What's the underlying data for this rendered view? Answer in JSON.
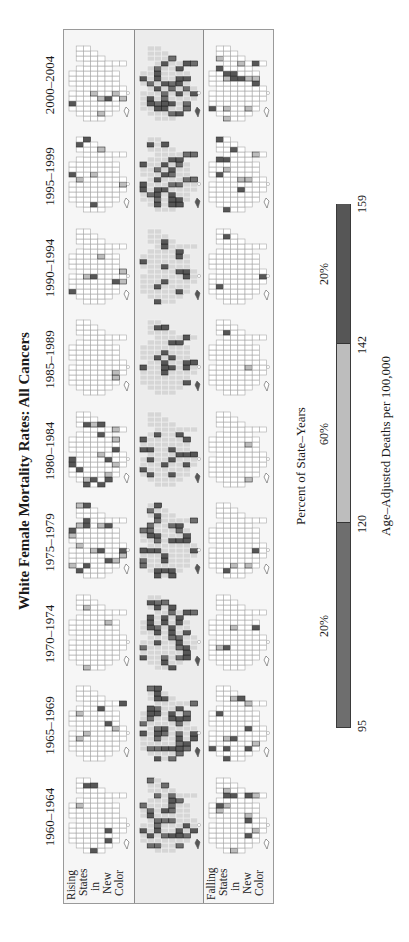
{
  "title": "White Female Mortality Rates: All Cancers",
  "periods": [
    "1960–1964",
    "1965–1969",
    "1970–1974",
    "1975–1979",
    "1980–1984",
    "1985–1989",
    "1990–1994",
    "1995–1999",
    "2000–2004"
  ],
  "row_labels": {
    "rising": [
      "Rising",
      "States",
      "in",
      "New",
      "Color"
    ],
    "falling": [
      "Falling",
      "States",
      "in",
      "New",
      "Color"
    ]
  },
  "legend": {
    "title": "Percent of State–Years",
    "percentages": [
      "20%",
      "60%",
      "20%"
    ],
    "ticks": [
      "95",
      "120",
      "142",
      "159"
    ],
    "axis_title": "Age–Adjusted Deaths per 100,000"
  },
  "colors": {
    "low": "#6e6e6e",
    "mid": "#bdbdbd",
    "high": "#565656",
    "map_base": "#d6d6d6",
    "state_outline": "#a8a8a8",
    "empty_state": "#ffffff"
  },
  "chart_data": {
    "type": "heatmap",
    "title": "White Female Mortality Rates: All Cancers",
    "subtype": "small-multiple choropleth maps (micromap) of US states",
    "orientation": "figure rotated 90° counter-clockwise",
    "x": [
      "1960–1964",
      "1965–1969",
      "1970–1974",
      "1975–1979",
      "1980–1984",
      "1985–1989",
      "1990–1994",
      "1995–1999",
      "2000–2004"
    ],
    "rows": [
      "Rising States in New Color",
      "All states (current classes)",
      "Falling States in New Color"
    ],
    "legend": {
      "classes": [
        {
          "range": [
            95,
            120
          ],
          "percent_of_state_years": "20%",
          "shade": "dark gray"
        },
        {
          "range": [
            120,
            142
          ],
          "percent_of_state_years": "60%",
          "shade": "light gray"
        },
        {
          "range": [
            142,
            159
          ],
          "percent_of_state_years": "20%",
          "shade": "dark gray"
        }
      ],
      "ticks": [
        95,
        120,
        142,
        159
      ],
      "xlabel": "Age–Adjusted Deaths per 100,000",
      "title": "Percent of State–Years"
    }
  }
}
